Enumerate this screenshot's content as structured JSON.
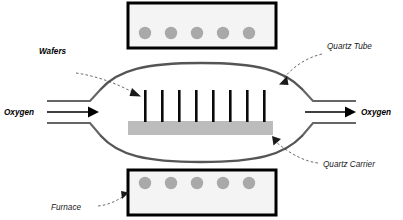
{
  "diagram": {
    "labels": {
      "wafers": "Wafers",
      "quartz_tube": "Quartz Tube",
      "quartz_carrier": "Quartz Carrier",
      "furnace": "Furnace",
      "oxygen_in": "Oxygen",
      "oxygen_out": "Oxygen"
    },
    "colors": {
      "background": "#ffffff",
      "tube_stroke": "#555555",
      "pipe_stroke": "#666666",
      "carrier_fill": "#bcbcbc",
      "wafer_fill": "#0a0a0a",
      "furnace_border": "#000000",
      "furnace_fill": "#f4f4f4",
      "coil_fill": "#a9a9a9",
      "leader_stroke": "#3a3a3a",
      "text": "#000000"
    },
    "counts": {
      "wafers": 8,
      "top_furnace_coils": 5,
      "bottom_furnace_coils": 5
    },
    "icons": {
      "flow_in": "arrow-right-icon",
      "flow_out": "arrow-right-icon",
      "leader_pointer": "arrowhead-icon"
    }
  }
}
